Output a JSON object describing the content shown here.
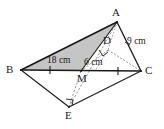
{
  "figure": {
    "background_color": "#ffffff",
    "stroke_color": "#1a1a1a",
    "shade_color": "#bdbdbd",
    "dash_color": "#8a8a8a",
    "vertices": [
      {
        "name": "A",
        "label": "A",
        "x": 117,
        "y": 22,
        "label_x": 112,
        "label_y": 7
      },
      {
        "name": "B",
        "label": "B",
        "x": 21,
        "y": 70,
        "label_x": 6,
        "label_y": 64
      },
      {
        "name": "C",
        "label": "C",
        "x": 141,
        "y": 71,
        "label_x": 145,
        "label_y": 65
      },
      {
        "name": "D",
        "label": "D",
        "x": 108,
        "y": 50,
        "label_x": 103,
        "label_y": 35
      },
      {
        "name": "M",
        "label": "M",
        "x": 81,
        "y": 71,
        "label_x": 77,
        "label_y": 73
      },
      {
        "name": "E",
        "label": "E",
        "x": 69,
        "y": 107,
        "label_x": 65,
        "label_y": 110
      }
    ],
    "measurements": [
      {
        "name": "bm-length",
        "text": "18 cm",
        "x": 47,
        "y": 55
      },
      {
        "name": "am-length",
        "text": "6 cm",
        "x": 84,
        "y": 57
      },
      {
        "name": "ac-length",
        "text": "9 cm",
        "x": 127,
        "y": 36
      }
    ],
    "edges": [
      {
        "name": "edge-AB",
        "from": "A",
        "to": "B",
        "style": "solid",
        "width": 1.6
      },
      {
        "name": "edge-AC",
        "from": "A",
        "to": "C",
        "style": "solid",
        "width": 1.4
      },
      {
        "name": "edge-AM",
        "from": "A",
        "to": "M",
        "style": "solid",
        "width": 1.2
      },
      {
        "name": "edge-BC",
        "from": "B",
        "to": "C",
        "style": "solid",
        "width": 1.3
      },
      {
        "name": "edge-BE",
        "from": "B",
        "to": "E",
        "style": "solid",
        "width": 1.2
      },
      {
        "name": "edge-EC",
        "from": "E",
        "to": "C",
        "style": "solid",
        "width": 1.2
      },
      {
        "name": "edge-ME",
        "from": "M",
        "to": "E",
        "style": "dashed",
        "width": 1.0
      },
      {
        "name": "edge-AE",
        "from": "A",
        "to": "E",
        "style": "dashed",
        "width": 1.0
      },
      {
        "name": "edge-DC",
        "from": "D",
        "to": "C",
        "style": "dashed",
        "width": 1.0
      },
      {
        "name": "edge-DM",
        "from": "D",
        "to": "M",
        "style": "dashed",
        "width": 1.0
      },
      {
        "name": "edge-AD-tick",
        "from": "A",
        "to": "D",
        "style": "dashed",
        "width": 1.0
      }
    ],
    "shaded_region": {
      "name": "triangle-ABM-shading",
      "vertices": [
        "A",
        "B",
        "M"
      ],
      "fill": "#bdbdbd",
      "opacity": 0.85
    },
    "tick_marks": [
      {
        "name": "tick-BM",
        "x": 50,
        "y": 70
      },
      {
        "name": "tick-MC",
        "x": 118,
        "y": 71
      }
    ],
    "right_angles": [
      {
        "name": "right-angle-at-D",
        "x": 101,
        "y": 53
      },
      {
        "name": "right-angle-at-E",
        "x": 71,
        "y": 101
      }
    ]
  }
}
